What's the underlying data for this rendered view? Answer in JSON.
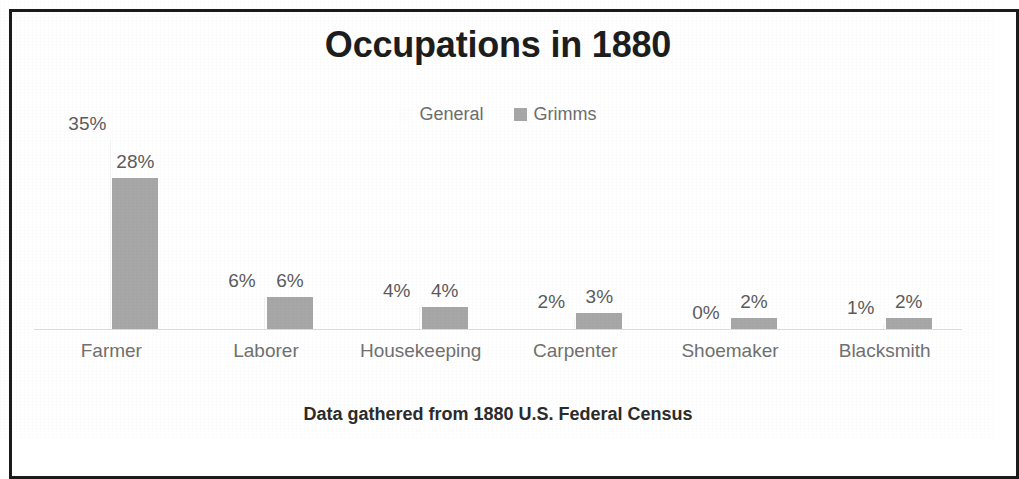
{
  "chart_data": {
    "type": "bar",
    "title": "Occupations in 1880",
    "subtitle": "Data gathered from 1880 U.S. Federal Census",
    "xlabel": "",
    "ylabel": "",
    "ylim": [
      0,
      35
    ],
    "grid": false,
    "legend_position": "top",
    "categories": [
      "Farmer",
      "Laborer",
      "Housekeeping",
      "Carpenter",
      "Shoemaker",
      "Blacksmith"
    ],
    "series": [
      {
        "name": "General",
        "color": "#ffffff",
        "values": [
          35,
          6,
          4,
          2,
          0,
          1
        ],
        "labels": [
          "35%",
          "6%",
          "4%",
          "2%",
          "0%",
          "1%"
        ]
      },
      {
        "name": "Grimms",
        "color": "#a7a7a7",
        "values": [
          28,
          6,
          4,
          3,
          2,
          2
        ],
        "labels": [
          "28%",
          "6%",
          "4%",
          "3%",
          "2%",
          "2%"
        ]
      }
    ]
  },
  "chart": {
    "title": "Occupations in 1880",
    "footer": "Data gathered from 1880 U.S. Federal Census",
    "legend": [
      {
        "label": "General",
        "color": "#ffffff"
      },
      {
        "label": "Grimms",
        "color": "#a7a7a7"
      }
    ],
    "axis_labels": [
      "Farmer",
      "Laborer",
      "Housekeeping",
      "Carpenter",
      "Shoemaker",
      "Blacksmith"
    ]
  },
  "colors": {
    "title_text": "#1d1d1d",
    "label_text": "#5c5c5c",
    "axis_text": "#707070",
    "bar_grimms": "#a7a7a7",
    "bar_general": "#ffffff",
    "baseline": "#dcdcdc",
    "frame": "#1b1b1b"
  }
}
